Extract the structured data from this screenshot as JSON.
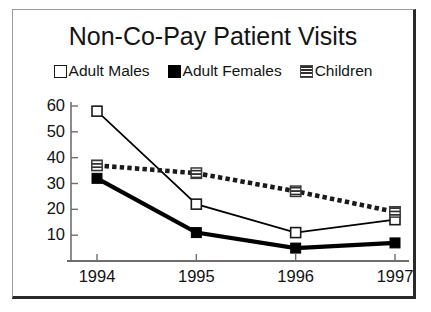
{
  "chart_data": {
    "type": "line",
    "title": "Non-Co-Pay Patient Visits",
    "xlabel": "",
    "ylabel": "",
    "categories": [
      "1994",
      "1995",
      "1996",
      "1997"
    ],
    "x": [
      1994,
      1995,
      1996,
      1997
    ],
    "ylim": [
      0,
      60
    ],
    "yticks": [
      10,
      20,
      30,
      40,
      50,
      60
    ],
    "grid": false,
    "legend_position": "top",
    "series": [
      {
        "name": "Adult Males",
        "values": [
          58,
          22,
          11,
          16
        ],
        "marker": "hollow-square",
        "line_style": "solid",
        "color": "#000000"
      },
      {
        "name": "Adult Females",
        "values": [
          32,
          11,
          5,
          7
        ],
        "marker": "filled-square",
        "line_style": "solid-thick",
        "color": "#000000"
      },
      {
        "name": "Children",
        "values": [
          37,
          34,
          27,
          19
        ],
        "marker": "striped-square",
        "line_style": "dotted-thick",
        "color": "#1a1a1a"
      }
    ]
  },
  "legend": {
    "items": [
      {
        "label": "Adult Males",
        "swatch": "hollow-square-icon"
      },
      {
        "label": "Adult Females",
        "swatch": "filled-square-icon"
      },
      {
        "label": "Children",
        "swatch": "striped-square-icon"
      }
    ]
  },
  "axes": {
    "y_labels": [
      "60",
      "50",
      "40",
      "30",
      "20",
      "10"
    ],
    "x_labels": [
      "1994",
      "1995",
      "1996",
      "1997"
    ]
  },
  "colors": {
    "axis": "#6e6e6e",
    "text": "#141414",
    "frame_light": "#9a9a9a",
    "frame_dark": "#2a2a2a",
    "series_ink": "#000000"
  }
}
